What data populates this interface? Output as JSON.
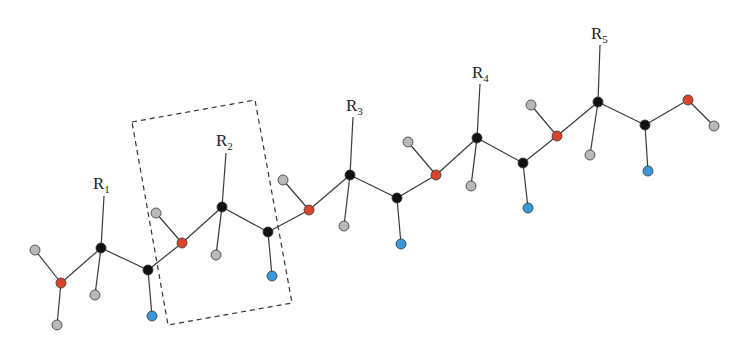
{
  "diagram": {
    "colors": {
      "carbon": "#111111",
      "hydrogen": "#b9b9b9",
      "nitrogen": "#d8452b",
      "oxygen": "#3a9ad9",
      "bond": "#3a3a3a"
    },
    "residue_labels": [
      {
        "base": "R",
        "sub": "1",
        "x": 93,
        "y": 189
      },
      {
        "base": "R",
        "sub": "2",
        "x": 216,
        "y": 146
      },
      {
        "base": "R",
        "sub": "3",
        "x": 346,
        "y": 111
      },
      {
        "base": "R",
        "sub": "4",
        "x": 472,
        "y": 78
      },
      {
        "base": "R",
        "sub": "5",
        "x": 591,
        "y": 39
      }
    ],
    "highlight_box": {
      "label": "repeating residue unit",
      "points": [
        [
          132,
          122
        ],
        [
          255,
          100
        ],
        [
          292,
          303
        ],
        [
          168,
          325
        ]
      ]
    },
    "atoms": [
      {
        "id": "H1a",
        "type": "hydrogen",
        "x": 35,
        "y": 250
      },
      {
        "id": "N1",
        "type": "nitrogen",
        "x": 61,
        "y": 283
      },
      {
        "id": "H1b",
        "type": "hydrogen",
        "x": 57,
        "y": 325
      },
      {
        "id": "CA1",
        "type": "carbon",
        "x": 101,
        "y": 248
      },
      {
        "id": "HA1",
        "type": "hydrogen",
        "x": 95,
        "y": 295
      },
      {
        "id": "C1",
        "type": "carbon",
        "x": 148,
        "y": 270
      },
      {
        "id": "O1",
        "type": "oxygen",
        "x": 152,
        "y": 316
      },
      {
        "id": "H2",
        "type": "hydrogen",
        "x": 156,
        "y": 213
      },
      {
        "id": "N2",
        "type": "nitrogen",
        "x": 182,
        "y": 243
      },
      {
        "id": "CA2",
        "type": "carbon",
        "x": 222,
        "y": 207
      },
      {
        "id": "HA2",
        "type": "hydrogen",
        "x": 216,
        "y": 255
      },
      {
        "id": "C2",
        "type": "carbon",
        "x": 268,
        "y": 232
      },
      {
        "id": "O2",
        "type": "oxygen",
        "x": 272,
        "y": 276
      },
      {
        "id": "H3",
        "type": "hydrogen",
        "x": 283,
        "y": 180
      },
      {
        "id": "N3",
        "type": "nitrogen",
        "x": 309,
        "y": 210
      },
      {
        "id": "CA3",
        "type": "carbon",
        "x": 350,
        "y": 175
      },
      {
        "id": "HA3",
        "type": "hydrogen",
        "x": 344,
        "y": 226
      },
      {
        "id": "C3",
        "type": "carbon",
        "x": 397,
        "y": 198
      },
      {
        "id": "O3",
        "type": "oxygen",
        "x": 401,
        "y": 244
      },
      {
        "id": "H4",
        "type": "hydrogen",
        "x": 408,
        "y": 142
      },
      {
        "id": "N4",
        "type": "nitrogen",
        "x": 436,
        "y": 175
      },
      {
        "id": "CA4",
        "type": "carbon",
        "x": 477,
        "y": 138
      },
      {
        "id": "HA4",
        "type": "hydrogen",
        "x": 471,
        "y": 186
      },
      {
        "id": "C4",
        "type": "carbon",
        "x": 523,
        "y": 163
      },
      {
        "id": "O4",
        "type": "oxygen",
        "x": 528,
        "y": 208
      },
      {
        "id": "H5",
        "type": "hydrogen",
        "x": 531,
        "y": 105
      },
      {
        "id": "N5",
        "type": "nitrogen",
        "x": 557,
        "y": 136
      },
      {
        "id": "CA5",
        "type": "carbon",
        "x": 598,
        "y": 102
      },
      {
        "id": "HA5",
        "type": "hydrogen",
        "x": 590,
        "y": 155
      },
      {
        "id": "C5",
        "type": "carbon",
        "x": 645,
        "y": 125
      },
      {
        "id": "O5",
        "type": "oxygen",
        "x": 648,
        "y": 171
      },
      {
        "id": "OT",
        "type": "nitrogen",
        "x": 688,
        "y": 100
      },
      {
        "id": "HT",
        "type": "hydrogen",
        "x": 714,
        "y": 126
      }
    ],
    "bonds": [
      [
        "H1a",
        "N1"
      ],
      [
        "N1",
        "H1b"
      ],
      [
        "N1",
        "CA1"
      ],
      [
        "CA1",
        "HA1"
      ],
      [
        "CA1",
        "C1"
      ],
      [
        "C1",
        "O1"
      ],
      [
        "C1",
        "N2"
      ],
      [
        "H2",
        "N2"
      ],
      [
        "N2",
        "CA2"
      ],
      [
        "CA2",
        "HA2"
      ],
      [
        "CA2",
        "C2"
      ],
      [
        "C2",
        "O2"
      ],
      [
        "C2",
        "N3"
      ],
      [
        "H3",
        "N3"
      ],
      [
        "N3",
        "CA3"
      ],
      [
        "CA3",
        "HA3"
      ],
      [
        "CA3",
        "C3"
      ],
      [
        "C3",
        "O3"
      ],
      [
        "C3",
        "N4"
      ],
      [
        "H4",
        "N4"
      ],
      [
        "N4",
        "CA4"
      ],
      [
        "CA4",
        "HA4"
      ],
      [
        "CA4",
        "C4"
      ],
      [
        "C4",
        "O4"
      ],
      [
        "C4",
        "N5"
      ],
      [
        "H5",
        "N5"
      ],
      [
        "N5",
        "CA5"
      ],
      [
        "CA5",
        "HA5"
      ],
      [
        "CA5",
        "C5"
      ],
      [
        "C5",
        "O5"
      ],
      [
        "C5",
        "OT"
      ],
      [
        "OT",
        "HT"
      ]
    ],
    "side_chain_lines": [
      {
        "from": [
          104,
          196
        ],
        "to": [
          101,
          248
        ]
      },
      {
        "from": [
          226,
          153
        ],
        "to": [
          222,
          207
        ]
      },
      {
        "from": [
          353,
          117
        ],
        "to": [
          350,
          175
        ]
      },
      {
        "from": [
          480,
          84
        ],
        "to": [
          477,
          138
        ]
      },
      {
        "from": [
          600,
          45
        ],
        "to": [
          598,
          102
        ]
      }
    ]
  }
}
